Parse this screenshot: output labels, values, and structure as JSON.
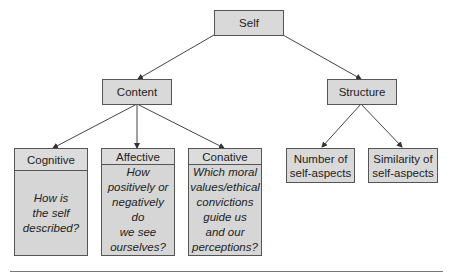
{
  "diagram": {
    "root": {
      "label": "Self"
    },
    "level1": [
      {
        "label": "Content"
      },
      {
        "label": "Structure"
      }
    ],
    "content_children": [
      {
        "title": "Cognitive",
        "question": "How is\nthe self\ndescribed?"
      },
      {
        "title": "Affective",
        "question": "How\npositively or\nnegatively do\nwe see\nourselves?"
      },
      {
        "title": "Conative",
        "question": "Which moral\nvalues/ethical\nconvictions\nguide us\nand our\nperceptions?"
      }
    ],
    "structure_children": [
      {
        "label": "Number of\nself-aspects"
      },
      {
        "label": "Similarity of\nself-aspects"
      }
    ]
  }
}
